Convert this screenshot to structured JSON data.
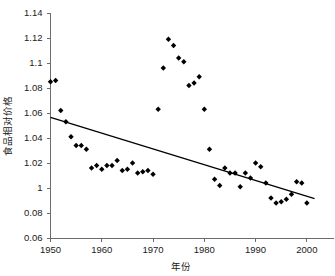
{
  "chart_data": {
    "type": "scatter",
    "title": "",
    "xlabel": "年份",
    "ylabel": "食品相对价格",
    "xlim": [
      1950,
      2001
    ],
    "ylim": [
      0.96,
      1.14
    ],
    "grid": false,
    "legend": null,
    "xticks": [
      1950,
      1960,
      1970,
      1980,
      1990,
      2000
    ],
    "xtick_labels": [
      "1950",
      "1960",
      "1970",
      "1980",
      "1990",
      "2000"
    ],
    "yticks": [
      1.14,
      1.12,
      1.1,
      1.08,
      1.06,
      1.04,
      1.02,
      1.0,
      0.98,
      0.96
    ],
    "ytick_labels": [
      "1.14",
      "1.12",
      "1.1",
      "1.08",
      "1.06",
      "1.04",
      "1.02",
      "1",
      "0.08",
      "0.06"
    ],
    "series": [
      {
        "name": "食品相对价格",
        "marker": "diamond",
        "color": "#000000",
        "x": [
          1950,
          1951,
          1952,
          1953,
          1954,
          1955,
          1956,
          1957,
          1958,
          1959,
          1960,
          1961,
          1962,
          1963,
          1964,
          1965,
          1966,
          1967,
          1968,
          1969,
          1970,
          1971,
          1972,
          1973,
          1974,
          1975,
          1976,
          1977,
          1978,
          1979,
          1980,
          1981,
          1982,
          1983,
          1984,
          1985,
          1986,
          1987,
          1988,
          1989,
          1990,
          1991,
          1992,
          1993,
          1994,
          1995,
          1996,
          1997,
          1998,
          1999,
          2000
        ],
        "y": [
          1.085,
          1.086,
          1.062,
          1.053,
          1.041,
          1.034,
          1.034,
          1.031,
          1.016,
          1.018,
          1.015,
          1.018,
          1.018,
          1.022,
          1.014,
          1.015,
          1.02,
          1.012,
          1.013,
          1.014,
          1.011,
          1.063,
          1.096,
          1.119,
          1.114,
          1.104,
          1.101,
          1.082,
          1.084,
          1.089,
          1.063,
          1.031,
          1.007,
          1.002,
          1.016,
          1.012,
          1.012,
          1.001,
          1.012,
          1.008,
          1.02,
          1.017,
          1.004,
          0.992,
          0.988,
          0.989,
          0.991,
          0.995,
          1.005,
          1.004,
          0.988
        ]
      }
    ],
    "trend_line": {
      "name": "线性趋势线",
      "color": "#000000",
      "x": [
        1950,
        2001.5
      ],
      "y": [
        1.0565,
        0.9915
      ]
    }
  }
}
